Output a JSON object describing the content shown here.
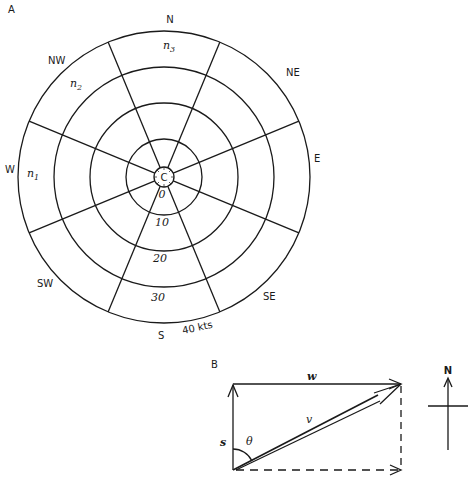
{
  "panel_a": {
    "label": "A",
    "directions": {
      "N": "N",
      "NE": "NE",
      "E": "E",
      "SE": "SE",
      "S": "S",
      "SW": "SW",
      "W": "W",
      "NW": "NW"
    },
    "sector_labels": {
      "n1": "n",
      "n1_sub": "1",
      "n2": "n",
      "n2_sub": "2",
      "n3": "n",
      "n3_sub": "3"
    },
    "center_label": "C",
    "ring_labels": [
      "0",
      "10",
      "20",
      "30",
      "40 kts"
    ]
  },
  "panel_b": {
    "label": "B",
    "vectors": {
      "w": "w",
      "v": "v",
      "s": "s",
      "theta": "θ"
    },
    "compass_label": "N"
  },
  "colors": {
    "ink": "#1a1a1a",
    "background": "#ffffff"
  }
}
